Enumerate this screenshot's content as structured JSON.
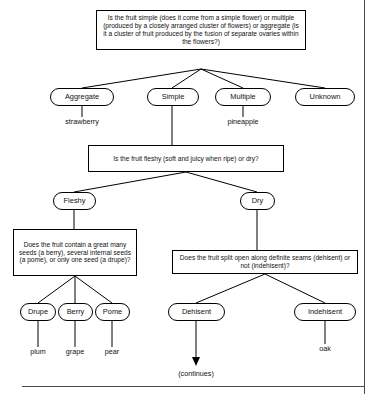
{
  "diagram": {
    "type": "decision-tree",
    "questions": {
      "q1": "Is the fruit simple (does it come from a simple flower) or multiple (produced by a closely arranged cluster of flowers) or aggregate (is it a cluster of fruit produced by the fusion of separate ovaries within the flowers?)",
      "q2": "Is the fruit fleshy (soft and juicy when ripe) or dry?",
      "q3": "Does the fruit contain a great many seeds (a berry), several internal seeds (a pome), or only one seed (a drupe)?",
      "q4": "Does the fruit split open along definite seams (dehisent) or not (indehisent)?"
    },
    "nodes": {
      "aggregate": "Aggregate",
      "simple": "Simple",
      "multiple": "Multiple",
      "unknown": "Unknown",
      "fleshy": "Fleshy",
      "dry": "Dry",
      "drupe": "Drupe",
      "berry": "Berry",
      "pome": "Pome",
      "dehisent": "Dehisent",
      "indehisent": "Indehisent"
    },
    "examples": {
      "strawberry": "strawberry",
      "pineapple": "pineapple",
      "plum": "plum",
      "grape": "grape",
      "pear": "pear",
      "oak": "oak",
      "continues": "(continues)"
    },
    "colors": {
      "stroke": "#000000",
      "text": "#111111",
      "background": "#ffffff",
      "frame": "#4a4a4a"
    }
  }
}
